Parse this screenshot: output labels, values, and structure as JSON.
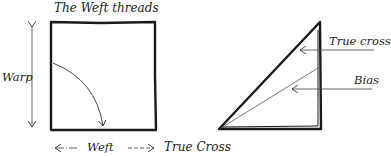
{
  "diagram": {
    "labels": {
      "top": "The Weft threads",
      "warp": "Warp",
      "weft": "Weft",
      "true_cross_bottom": "True Cross",
      "true_cross_right": "True cross",
      "bias": "Bias"
    },
    "colors": {
      "ink": "#1a1a1a",
      "thin": "#555555"
    }
  }
}
